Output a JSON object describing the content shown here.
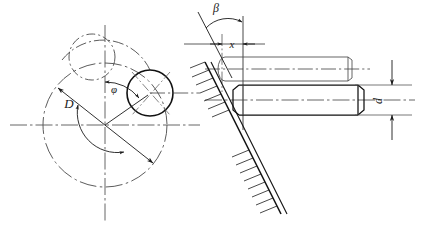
{
  "drawing": {
    "title": "Cylindrical pin on inclined surface — kinematic layout",
    "kind": "engineering-line-drawing",
    "colors": {
      "line": "#1a1a1a",
      "thin_line": "#3a3a3a",
      "center_line": "#555555",
      "background": "#ffffff"
    },
    "labels": {
      "diameter_large": "D",
      "angle_phi": "φ",
      "angle_beta": "β",
      "offset_x": "x",
      "diameter_pin": "d"
    },
    "left_view": {
      "name": "plan-view-disc",
      "large_circle": {
        "label": "D",
        "style": "dash-dot",
        "center": [
          105,
          125
        ],
        "radius": 62
      },
      "roller_circle_solid": {
        "style": "solid",
        "center": [
          150,
          93
        ],
        "radius": 23
      },
      "roller_circle_phantom": {
        "style": "dash-dot",
        "center": [
          92,
          57
        ],
        "radius": 23
      },
      "angle_arc": {
        "label": "φ",
        "from": "vertical-centerline",
        "to": "roller-center-line"
      }
    },
    "right_view": {
      "name": "elevation-view-pin",
      "inclined_surface": {
        "hatched": true,
        "label": "β",
        "hatch_side": "upper-left"
      },
      "pin_lower": {
        "style": "solid",
        "label": "d",
        "chamfered": true
      },
      "pin_upper_phantom": {
        "style": "thin-phantom",
        "chamfered": true
      },
      "dimension_x": {
        "label": "x",
        "type": "linear-between-arrows"
      },
      "dimension_d": {
        "label": "d",
        "type": "vertical-diameter",
        "rotated": true
      }
    }
  }
}
